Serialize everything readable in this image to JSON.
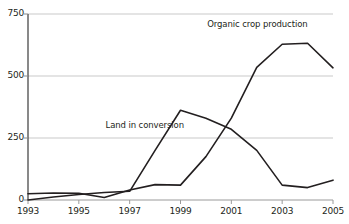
{
  "chart_data": {
    "type": "line",
    "title": "",
    "xlabel": "",
    "ylabel": "",
    "x": [
      1993,
      1994,
      1995,
      1996,
      1997,
      1998,
      1999,
      2000,
      2001,
      2002,
      2003,
      2004,
      2005
    ],
    "xlim": [
      1993,
      2005
    ],
    "ylim": [
      0,
      750
    ],
    "yticks": [
      0,
      250,
      500,
      750
    ],
    "ytick_labels": [
      "0",
      "250",
      "500",
      "750"
    ],
    "xticks": [
      1993,
      1995,
      1997,
      1999,
      2001,
      2003,
      2005
    ],
    "xtick_labels": [
      "1993",
      "1995",
      "1997",
      "1999",
      "2001",
      "2003",
      "2005"
    ],
    "grid": true,
    "grid_axis": "y",
    "legend_position": "inline-annotations",
    "series": [
      {
        "name": "Organic crop production",
        "color": "#231f20",
        "values": [
          25,
          28,
          27,
          10,
          40,
          62,
          60,
          175,
          330,
          535,
          628,
          632,
          533
        ]
      },
      {
        "name": "Land in conversion",
        "color": "#231f20",
        "values": [
          0,
          12,
          22,
          30,
          35,
          200,
          362,
          330,
          285,
          200,
          60,
          50,
          80
        ]
      }
    ],
    "annotations": [
      {
        "text": "Organic crop production",
        "x": 2000.05,
        "y": 705
      },
      {
        "text": "Land in conversion",
        "x": 1996.05,
        "y": 300
      }
    ]
  },
  "axis": {
    "y_axis_name": "y-axis",
    "x_axis_name": "x-axis"
  }
}
